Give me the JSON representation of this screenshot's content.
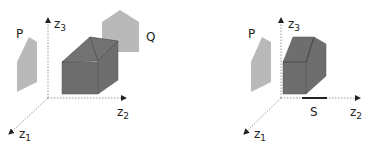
{
  "panels": [
    {
      "id": "left",
      "labels": {
        "z1": "z",
        "z1_sub": "1",
        "z2": "z",
        "z2_sub": "2",
        "z3": "z",
        "z3_sub": "3",
        "P": "P",
        "Q": "Q"
      }
    },
    {
      "id": "right",
      "labels": {
        "z1": "z",
        "z1_sub": "1",
        "z2": "z",
        "z2_sub": "2",
        "z3": "z",
        "z3_sub": "3",
        "P": "P",
        "S": "S"
      }
    }
  ],
  "colors": {
    "light_gray": "#b9b9b9",
    "dark_gray": "#6e6e6e",
    "edge": "#444444",
    "axis": "#999999"
  }
}
